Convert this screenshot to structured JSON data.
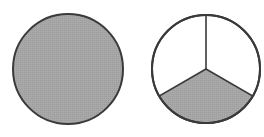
{
  "figure": {
    "colors": {
      "fill": "#a8a8a8",
      "stroke": "#3a3a3a",
      "background": "#ffffff"
    },
    "circles": [
      {
        "name": "whole-circle",
        "cx": 68,
        "cy": 69,
        "r": 55,
        "parts": 1,
        "shaded_parts": 1
      },
      {
        "name": "thirds-circle",
        "cx": 206,
        "cy": 69,
        "r": 54,
        "parts": 3,
        "shaded_parts": 1
      }
    ]
  }
}
